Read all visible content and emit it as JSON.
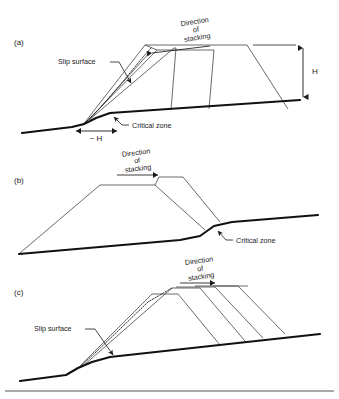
{
  "figure": {
    "type": "cross-section-diagram",
    "width": 339,
    "height": 399,
    "background": "#ffffff",
    "line_color": "#111111",
    "stack_color": "#3a3a3a"
  },
  "panels": [
    {
      "id": "a",
      "label": "(a)",
      "description": "Stacking advancing downslope (right to left) over flat-then-rising ground; slip surface and critical zone at the toe, H height dimension at right",
      "direction_arrow": "left",
      "annotations": {
        "direction": {
          "line1": "Direction",
          "line2": "of",
          "line3": "stacking"
        },
        "slip_surface": "Slip surface",
        "critical_zone": "Critical zone",
        "height": "H",
        "base_width": "~ H"
      }
    },
    {
      "id": "b",
      "label": "(b)",
      "description": "Stacking advancing upslope (left to right); critical zone located where the stack toe meets the steepening ground",
      "direction_arrow": "right",
      "annotations": {
        "direction": {
          "line1": "Direction",
          "line2": "of",
          "line3": "stacking"
        },
        "critical_zone": "Critical zone"
      }
    },
    {
      "id": "c",
      "label": "(c)",
      "description": "Multiple lifts stacked left to right on a sloping foundation with a slip surface through the upslope toe",
      "direction_arrow": "right",
      "annotations": {
        "direction": {
          "line1": "Direction",
          "line2": "of",
          "line3": "stacking"
        },
        "slip_surface": "Slip surface"
      }
    }
  ]
}
